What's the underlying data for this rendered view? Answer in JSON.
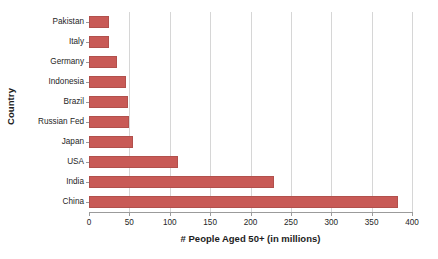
{
  "chart_data": {
    "type": "bar",
    "orientation": "horizontal",
    "title": "",
    "xlabel": "# People Aged 50+ (in millions)",
    "ylabel": "Country",
    "categories": [
      "China",
      "India",
      "USA",
      "Japan",
      "Russian Fed",
      "Brazil",
      "Indonesia",
      "Germany",
      "Italy",
      "Pakistan"
    ],
    "values": [
      383,
      229,
      110,
      55,
      50,
      48,
      46,
      35,
      25,
      25
    ],
    "series": [
      {
        "name": "# People Aged 50+ (in millions)",
        "values": [
          383,
          229,
          110,
          55,
          50,
          48,
          46,
          35,
          25,
          25
        ]
      }
    ],
    "xlim": [
      0,
      400
    ],
    "xticks": [
      0,
      50,
      100,
      150,
      200,
      250,
      300,
      350,
      400
    ],
    "xtick_labels": [
      "0",
      "50",
      "100",
      "150",
      "200",
      "250",
      "300",
      "350",
      "400"
    ],
    "grid": "vertical",
    "legend": "none",
    "bar_color": "#c85a56",
    "bar_edge_color": "#b2504c",
    "gridline_color": "#d6d6d6",
    "axis_color": "#9b9b9b",
    "category_order_top_to_bottom": [
      "Pakistan",
      "Italy",
      "Germany",
      "Indonesia",
      "Brazil",
      "Russian Fed",
      "Japan",
      "USA",
      "India",
      "China"
    ]
  }
}
